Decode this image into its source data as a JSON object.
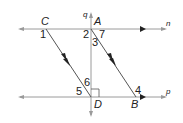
{
  "diagram": {
    "lines": {
      "n": "n",
      "p": "p",
      "q": "q"
    },
    "points": {
      "A": "A",
      "B": "B",
      "C": "C",
      "D": "D"
    },
    "angles": [
      "1",
      "2",
      "3",
      "4",
      "5",
      "6",
      "7"
    ],
    "colors": {
      "line": "#999999",
      "transversal": "#555555",
      "arrow": "#222222",
      "text": "#222222"
    },
    "features": {
      "parallel_marks": "CD and AB marked parallel (double arrowheads)",
      "parallel_lines": "n and p marked parallel (single arrowheads)",
      "right_angle": "at D between q and p"
    }
  }
}
